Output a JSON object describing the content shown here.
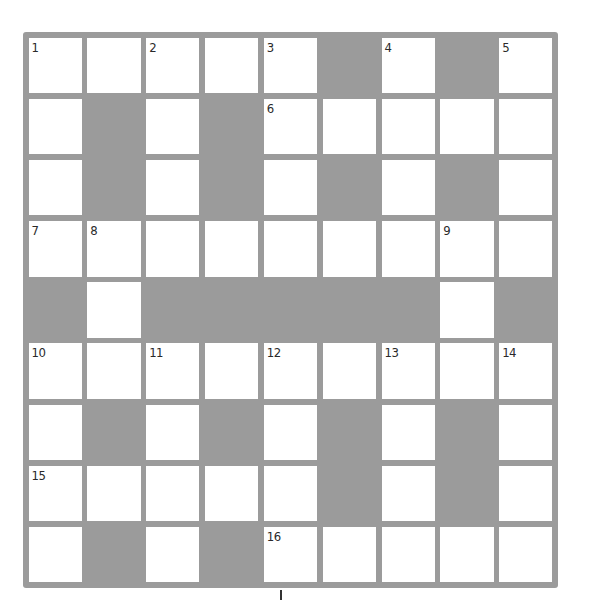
{
  "puzzle": {
    "type": "crossword",
    "rows": 9,
    "cols": 9,
    "colors": {
      "block": "#9b9b9b",
      "cell": "#ffffff",
      "number": "#2a2a2a"
    },
    "layout": [
      "WWWWWBWBW",
      "WBWBWWWWW",
      "WBWBWBWBW",
      "WWWWWWWWW",
      "BWBBBBBWB",
      "WWWWWWWWW",
      "WBWBWBWBW",
      "WWWWWBWBW",
      "WBWBWWWWW"
    ],
    "numbers": [
      {
        "row": 0,
        "col": 0,
        "label": "1"
      },
      {
        "row": 0,
        "col": 2,
        "label": "2"
      },
      {
        "row": 0,
        "col": 4,
        "label": "3"
      },
      {
        "row": 0,
        "col": 6,
        "label": "4"
      },
      {
        "row": 0,
        "col": 8,
        "label": "5"
      },
      {
        "row": 1,
        "col": 4,
        "label": "6"
      },
      {
        "row": 3,
        "col": 0,
        "label": "7"
      },
      {
        "row": 3,
        "col": 1,
        "label": "8"
      },
      {
        "row": 3,
        "col": 7,
        "label": "9"
      },
      {
        "row": 5,
        "col": 0,
        "label": "10"
      },
      {
        "row": 5,
        "col": 2,
        "label": "11"
      },
      {
        "row": 5,
        "col": 4,
        "label": "12"
      },
      {
        "row": 5,
        "col": 6,
        "label": "13"
      },
      {
        "row": 5,
        "col": 8,
        "label": "14"
      },
      {
        "row": 7,
        "col": 0,
        "label": "15"
      },
      {
        "row": 8,
        "col": 4,
        "label": "16"
      }
    ]
  }
}
